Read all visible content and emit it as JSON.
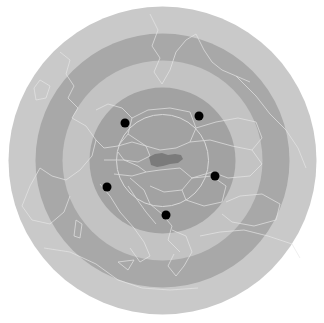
{
  "map": {
    "width": 324,
    "height": 323,
    "center": {
      "x": 162.5,
      "y": 160.5
    },
    "background": "#ffffff",
    "rings": [
      {
        "name": "outer-zone",
        "radius": 154,
        "color": "#c9c9c9"
      },
      {
        "name": "second-dark-band",
        "radius": 127,
        "color": "#a8a8a8"
      },
      {
        "name": "third-light-band",
        "radius": 100,
        "color": "#c3c3c3"
      },
      {
        "name": "inner-zone",
        "radius": 73,
        "color": "#a2a2a2"
      }
    ],
    "inner_circle": {
      "radius": 46,
      "stroke": "#d8d8d8"
    },
    "border_color": "#e6e6e6",
    "highlight_country": {
      "name": "Slovakia",
      "color": "#7b7b7b"
    },
    "points": [
      {
        "id": "point-nw",
        "x": 125,
        "y": 123
      },
      {
        "id": "point-ne",
        "x": 199,
        "y": 116
      },
      {
        "id": "point-e",
        "x": 215,
        "y": 176
      },
      {
        "id": "point-sw",
        "x": 107,
        "y": 187
      },
      {
        "id": "point-s",
        "x": 166,
        "y": 215
      }
    ],
    "point_color": "#000000",
    "point_radius": 4.5
  }
}
